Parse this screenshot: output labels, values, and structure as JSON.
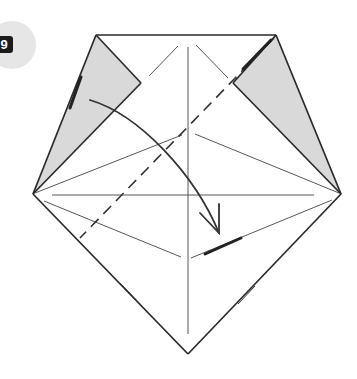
{
  "step": {
    "number": "9",
    "badge_color": "#e6e6e6",
    "number_box_color": "#1a1a1a",
    "number_text_color": "#ffffff"
  },
  "diagram": {
    "outline_color": "#2a2a2a",
    "crease_color": "#444444",
    "shade_color": "#d9d9d9",
    "arrow_color": "#333333",
    "annotations": {
      "fold_line": "valley fold (dashed)",
      "arrow": "fold top-left flap down toward center"
    }
  },
  "caption": {
    "text": ""
  }
}
